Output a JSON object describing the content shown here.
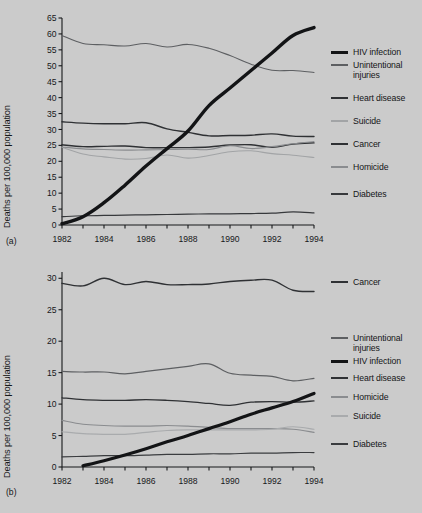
{
  "figure": {
    "background_color": "#cbcbcb",
    "ink_color": "#17181a"
  },
  "chart_data": [
    {
      "id": "panel-a",
      "type": "line",
      "panel_tag": "(a)",
      "title": "",
      "xlabel": "",
      "ylabel": "Deaths per 100,000 population",
      "xlim": [
        1982,
        1994
      ],
      "ylim": [
        0,
        65
      ],
      "xticks": [
        1982,
        1983,
        1984,
        1985,
        1986,
        1987,
        1988,
        1989,
        1990,
        1991,
        1992,
        1993,
        1994
      ],
      "xtick_labels": [
        "1982",
        "",
        "1984",
        "",
        "1986",
        "",
        "1988",
        "",
        "1990",
        "",
        "1992",
        "",
        "1994"
      ],
      "yticks": [
        0,
        5,
        10,
        15,
        20,
        25,
        30,
        35,
        40,
        45,
        50,
        55,
        60,
        65
      ],
      "ytick_labels": [
        "0",
        "5",
        "10",
        "15",
        "20",
        "25",
        "30",
        "35",
        "40",
        "45",
        "50",
        "55",
        "60",
        "65"
      ],
      "grid": false,
      "legend_position": "right",
      "x": [
        1982,
        1983,
        1984,
        1985,
        1986,
        1987,
        1988,
        1989,
        1990,
        1991,
        1992,
        1993,
        1994
      ],
      "series": [
        {
          "name": "HIV infection",
          "color": "#131416",
          "width": 3.4,
          "values": [
            0.4,
            2.6,
            7.0,
            12.5,
            18.5,
            24.0,
            29.5,
            37.5,
            43.0,
            48.5,
            54.0,
            59.5,
            62.0
          ]
        },
        {
          "name": "Unintentional injuries",
          "color": "#5d5f62",
          "width": 1.1,
          "values": [
            59.5,
            57.0,
            56.6,
            56.2,
            57.0,
            55.9,
            56.7,
            55.5,
            53.2,
            50.5,
            48.6,
            48.5,
            47.9
          ]
        },
        {
          "name": "Heart disease",
          "color": "#2f3134",
          "width": 1.4,
          "values": [
            32.4,
            32.0,
            31.8,
            31.8,
            32.1,
            30.2,
            29.1,
            28.0,
            28.1,
            28.2,
            28.6,
            27.9,
            27.8
          ]
        },
        {
          "name": "Suicide",
          "color": "#a2a4a6",
          "width": 1.1,
          "values": [
            24.4,
            22.3,
            21.4,
            20.7,
            20.9,
            22.0,
            21.0,
            21.8,
            23.0,
            23.3,
            22.4,
            21.9,
            21.2
          ]
        },
        {
          "name": "Cancer",
          "color": "#2f3134",
          "width": 1.4,
          "values": [
            25.2,
            24.6,
            24.7,
            24.8,
            24.3,
            24.3,
            24.3,
            24.5,
            25.1,
            25.2,
            24.4,
            25.4,
            25.8
          ]
        },
        {
          "name": "Homicide",
          "color": "#8a8c8f",
          "width": 1.1,
          "values": [
            24.5,
            23.9,
            23.7,
            23.5,
            23.6,
            23.7,
            23.8,
            23.7,
            24.9,
            24.0,
            24.6,
            25.5,
            26.2
          ]
        },
        {
          "name": "Diabetes",
          "color": "#37393c",
          "width": 1.2,
          "values": [
            2.6,
            2.9,
            3.0,
            3.1,
            3.2,
            3.3,
            3.4,
            3.5,
            3.5,
            3.6,
            3.7,
            4.1,
            3.8
          ]
        }
      ],
      "legend_entries": [
        {
          "label": "HIV infection",
          "color": "#131416",
          "width": 3.4
        },
        {
          "label": "Unintentional injuries",
          "color": "#5d5f62",
          "width": 1.6
        },
        {
          "label": "Heart disease",
          "color": "#2f3134",
          "width": 1.8
        },
        {
          "label": "Suicide",
          "color": "#a2a4a6",
          "width": 1.4
        },
        {
          "label": "Cancer",
          "color": "#2f3134",
          "width": 1.8
        },
        {
          "label": "Homicide",
          "color": "#8a8c8f",
          "width": 1.4
        },
        {
          "label": "Diabetes",
          "color": "#37393c",
          "width": 1.8
        }
      ]
    },
    {
      "id": "panel-b",
      "type": "line",
      "panel_tag": "(b)",
      "title": "",
      "xlabel": "",
      "ylabel": "Deaths per 100,000 population",
      "xlim": [
        1982,
        1994
      ],
      "ylim": [
        0,
        31
      ],
      "xticks": [
        1982,
        1983,
        1984,
        1985,
        1986,
        1987,
        1988,
        1989,
        1990,
        1991,
        1992,
        1993,
        1994
      ],
      "xtick_labels": [
        "1982",
        "",
        "1984",
        "",
        "1986",
        "",
        "1988",
        "",
        "1990",
        "",
        "1992",
        "",
        "1994"
      ],
      "yticks": [
        0,
        5,
        10,
        15,
        20,
        25,
        30
      ],
      "ytick_labels": [
        "0",
        "5",
        "10",
        "15",
        "20",
        "25",
        "30"
      ],
      "grid": false,
      "legend_position": "right",
      "x": [
        1982,
        1983,
        1984,
        1985,
        1986,
        1987,
        1988,
        1989,
        1990,
        1991,
        1992,
        1993,
        1994
      ],
      "series": [
        {
          "name": "Cancer",
          "color": "#2f3134",
          "width": 1.4,
          "values": [
            29.2,
            28.8,
            30.0,
            29.0,
            29.5,
            29.0,
            29.0,
            29.1,
            29.5,
            29.7,
            29.7,
            28.1,
            27.9
          ]
        },
        {
          "name": "Unintentional injuries",
          "color": "#5d5f62",
          "width": 1.2,
          "values": [
            15.2,
            15.1,
            15.1,
            14.8,
            15.2,
            15.6,
            16.0,
            16.4,
            14.9,
            14.6,
            14.4,
            13.7,
            14.1
          ]
        },
        {
          "name": "HIV infection",
          "color": "#131416",
          "width": 3.2,
          "values": [
            0.0,
            0.2,
            1.0,
            1.9,
            2.9,
            4.0,
            5.0,
            6.1,
            7.2,
            8.4,
            9.4,
            10.4,
            11.7
          ]
        },
        {
          "name": "Heart disease",
          "color": "#2f3134",
          "width": 1.3,
          "values": [
            11.0,
            10.7,
            10.6,
            10.6,
            10.7,
            10.6,
            10.4,
            10.1,
            9.8,
            10.3,
            10.4,
            10.3,
            10.5
          ]
        },
        {
          "name": "Homicide",
          "color": "#8a8c8f",
          "width": 1.2,
          "values": [
            7.4,
            6.8,
            6.6,
            6.5,
            6.5,
            6.6,
            6.5,
            6.3,
            6.1,
            6.1,
            6.1,
            6.0,
            5.5
          ]
        },
        {
          "name": "Suicide",
          "color": "#a9abad",
          "width": 1.2,
          "values": [
            5.6,
            5.3,
            5.2,
            5.2,
            5.5,
            5.8,
            5.9,
            5.9,
            5.9,
            5.9,
            6.0,
            6.4,
            6.0
          ]
        },
        {
          "name": "Diabetes",
          "color": "#3a3c3f",
          "width": 1.2,
          "values": [
            1.6,
            1.7,
            1.8,
            1.8,
            1.9,
            2.0,
            2.0,
            2.1,
            2.1,
            2.2,
            2.2,
            2.3,
            2.3
          ]
        }
      ],
      "legend_entries": [
        {
          "label": "Cancer",
          "color": "#2f3134",
          "width": 1.8
        },
        {
          "label": "Unintentional injuries",
          "color": "#5d5f62",
          "width": 1.6
        },
        {
          "label": "HIV infection",
          "color": "#131416",
          "width": 3.4
        },
        {
          "label": "Heart disease",
          "color": "#2f3134",
          "width": 1.8
        },
        {
          "label": "Homicide",
          "color": "#8a8c8f",
          "width": 1.4
        },
        {
          "label": "Suicide",
          "color": "#a9abad",
          "width": 1.4
        },
        {
          "label": "Diabetes",
          "color": "#3a3c3f",
          "width": 1.8
        }
      ]
    }
  ]
}
